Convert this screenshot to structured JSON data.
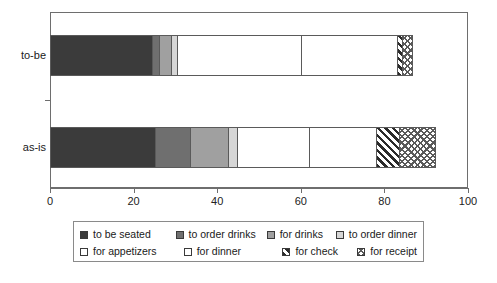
{
  "chart_data": {
    "type": "bar",
    "orientation": "horizontal",
    "stacked": true,
    "title": "",
    "xlabel": "",
    "ylabel": "",
    "xlim": [
      0,
      100
    ],
    "xticks": [
      0,
      20,
      40,
      60,
      80,
      100
    ],
    "grid": false,
    "legend_position": "bottom",
    "categories": [
      "to-be",
      "as-is"
    ],
    "series": [
      {
        "name": "to be seated",
        "values": [
          24.5,
          25.0
        ]
      },
      {
        "name": "to order drinks",
        "values": [
          1.5,
          8.5
        ]
      },
      {
        "name": "for drinks",
        "values": [
          3.0,
          9.0
        ]
      },
      {
        "name": "to order dinner",
        "values": [
          1.3,
          2.2
        ]
      },
      {
        "name": "for appetizers",
        "values": [
          29.7,
          17.3
        ]
      },
      {
        "name": "for dinner",
        "values": [
          23.0,
          16.0
        ]
      },
      {
        "name": "for check",
        "values": [
          1.3,
          5.5
        ]
      },
      {
        "name": "for receipt",
        "values": [
          2.2,
          8.5
        ]
      }
    ],
    "totals": [
      86.5,
      92.0
    ]
  },
  "axis": {
    "tick_labels": [
      "0",
      "20",
      "40",
      "60",
      "80",
      "100"
    ]
  },
  "categories": {
    "to_be": "to-be",
    "as_is": "as-is"
  },
  "legend": {
    "row1": [
      {
        "label": "to be seated",
        "pattern": "solid-black",
        "color": "#3b3b3b"
      },
      {
        "label": "to order drinks",
        "pattern": "solid-dkgray",
        "color": "#6f6f6f"
      },
      {
        "label": "for drinks",
        "pattern": "solid-mdgray",
        "color": "#a0a0a0"
      },
      {
        "label": "to order dinner",
        "pattern": "solid-ltgray",
        "color": "#d6d6d6"
      }
    ],
    "row2": [
      {
        "label": "for appetizers",
        "pattern": "solid-white",
        "color": "#ffffff"
      },
      {
        "label": "for dinner",
        "pattern": "dotted",
        "color": "#707070"
      },
      {
        "label": "for check",
        "pattern": "diagonal",
        "color": "#2b2b2b"
      },
      {
        "label": "for receipt",
        "pattern": "crosshatch",
        "color": "#5a5a5a"
      }
    ]
  }
}
